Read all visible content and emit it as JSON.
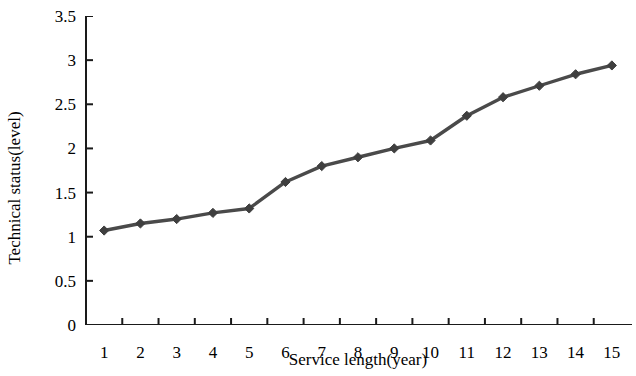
{
  "chart_data": {
    "type": "line",
    "title": "",
    "xlabel": "Service length(year)",
    "ylabel": "Technical status(level)",
    "x": [
      1,
      2,
      3,
      4,
      5,
      6,
      7,
      8,
      9,
      10,
      11,
      12,
      13,
      14,
      15
    ],
    "values": [
      1.07,
      1.15,
      1.2,
      1.27,
      1.32,
      1.62,
      1.8,
      1.9,
      2.0,
      2.09,
      2.37,
      2.58,
      2.71,
      2.84,
      2.94
    ],
    "series": [
      {
        "name": "Technical status",
        "values": [
          1.07,
          1.15,
          1.2,
          1.27,
          1.32,
          1.62,
          1.8,
          1.9,
          2.0,
          2.09,
          2.37,
          2.58,
          2.71,
          2.84,
          2.94
        ]
      }
    ],
    "xlim": [
      0.5,
      15.5
    ],
    "ylim": [
      0,
      3.5
    ],
    "x_tick_labels": [
      "1",
      "2",
      "3",
      "4",
      "5",
      "6",
      "7",
      "8",
      "9",
      "10",
      "11",
      "12",
      "13",
      "14",
      "15"
    ],
    "y_tick_labels": [
      "0",
      "0.5",
      "1",
      "1.5",
      "2",
      "2.5",
      "3",
      "3.5"
    ],
    "y_tick_values": [
      0,
      0.5,
      1,
      1.5,
      2,
      2.5,
      3,
      3.5
    ],
    "grid": false,
    "legend": false,
    "legend_position": "none",
    "line_color": "#4a4a4a",
    "marker": "diamond",
    "marker_color": "#3f3f3f",
    "axis_color": "#1a1a1a",
    "background_color": "#ffffff"
  }
}
